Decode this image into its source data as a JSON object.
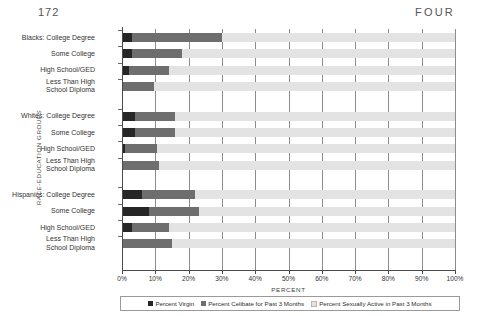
{
  "page": {
    "folio": "172",
    "running_head": "FOUR"
  },
  "chart_data": {
    "type": "bar",
    "orientation": "horizontal",
    "stacked": true,
    "title": "",
    "xlabel": "PERCENT",
    "ylabel": "RACE-EDUCATION GROUPS",
    "xlim": [
      0,
      100
    ],
    "xticks": [
      "0%",
      "10%",
      "20%",
      "30%",
      "40%",
      "50%",
      "60%",
      "70%",
      "80%",
      "90%",
      "100%"
    ],
    "xtick_values": [
      0,
      10,
      20,
      30,
      40,
      50,
      60,
      70,
      80,
      90,
      100
    ],
    "grid": "vertical",
    "legend_position": "bottom",
    "legend": [
      "Percent Virgin",
      "Percent Celibate for Past 3 Months",
      "Percent Sexually Active in Past 3 Months"
    ],
    "colors": {
      "virgin": "#262626",
      "celibate": "#6e6e6e",
      "active": "#e3e3e3"
    },
    "series": [
      {
        "name": "Percent Virgin",
        "key": "virgin",
        "values": [
          3,
          3,
          2,
          0,
          4,
          4,
          1,
          0,
          6,
          8,
          3,
          0
        ]
      },
      {
        "name": "Percent Celibate for Past 3 Months",
        "key": "celibate",
        "values": [
          27,
          15,
          12,
          9.5,
          12,
          12,
          9.5,
          11,
          16,
          15,
          11,
          15
        ]
      },
      {
        "name": "Percent Sexually Active in Past 3 Months",
        "key": "active",
        "values": [
          70,
          82,
          86,
          90.5,
          84,
          84,
          89.5,
          89,
          78,
          77,
          86,
          85
        ]
      }
    ],
    "categories": [
      "Blacks:  College Degree",
      "Some College",
      "High School/GED",
      "Less Than High\nSchool Diploma",
      "Whites:  College Degree",
      "Some College",
      "High School/GED",
      "Less Than High\nSchool Diploma",
      "Hispanics:  College Degree",
      "Some College",
      "High School/GED",
      "Less Than High\nSchool Diploma"
    ],
    "groups": [
      "Blacks",
      "Whites",
      "Hispanics"
    ]
  }
}
